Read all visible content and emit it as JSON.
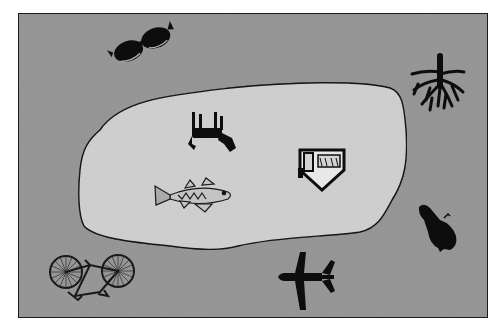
{
  "figure": {
    "frame": {
      "x": 18,
      "y": 13,
      "width": 470,
      "height": 305,
      "fill": "#9a9a9a",
      "stroke": "#222222"
    },
    "region": {
      "fill": "#d2d2d2",
      "stroke": "#1a1a1a"
    },
    "icon_color": "#0d0d0d",
    "inside_region": [
      {
        "name": "dog",
        "x": 210,
        "y": 132
      },
      {
        "name": "fish",
        "x": 192,
        "y": 197
      },
      {
        "name": "house",
        "x": 322,
        "y": 167
      }
    ],
    "outside_region": [
      {
        "name": "sunglasses",
        "x": 142,
        "y": 44
      },
      {
        "name": "tree-roots",
        "x": 432,
        "y": 82
      },
      {
        "name": "bottle",
        "x": 438,
        "y": 226
      },
      {
        "name": "airplane",
        "x": 306,
        "y": 277
      },
      {
        "name": "bicycle",
        "x": 90,
        "y": 278
      }
    ]
  }
}
